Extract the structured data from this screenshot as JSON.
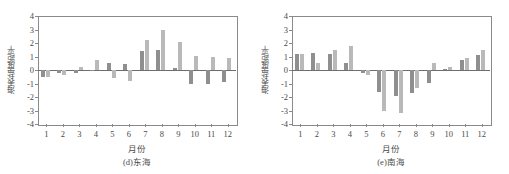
{
  "figure": {
    "ylabel": "海表盐度距平",
    "xlabel": "月份",
    "yticks": [
      "4",
      "3",
      "2",
      "1",
      "0",
      "-1",
      "-2",
      "-3",
      "-4"
    ],
    "xticks": [
      "1",
      "2",
      "3",
      "4",
      "5",
      "6",
      "7",
      "8",
      "9",
      "10",
      "11",
      "12"
    ],
    "colors": {
      "series1": "#8f8f8f",
      "series2": "#b9b9b9",
      "axis": "#8a8a8a",
      "text": "#4a4a4a"
    }
  },
  "chart_data": [
    {
      "type": "bar",
      "title": "(d)东海",
      "panel": "d",
      "xlabel": "月份",
      "ylabel": "海表盐度距平",
      "ylim": [
        -4,
        4
      ],
      "yticks": [
        4,
        3,
        2,
        1,
        0,
        -1,
        -2,
        -3,
        -4
      ],
      "grid": false,
      "legend": "none",
      "categories": [
        "1",
        "2",
        "3",
        "4",
        "5",
        "6",
        "7",
        "8",
        "9",
        "10",
        "11",
        "12"
      ],
      "series": [
        {
          "name": "series1",
          "color": "#8f8f8f",
          "values": [
            -0.55,
            -0.25,
            -0.2,
            -0.1,
            0.5,
            0.45,
            1.4,
            1.5,
            0.15,
            -1.0,
            -1.0,
            -0.9
          ]
        },
        {
          "name": "series2",
          "color": "#b9b9b9",
          "values": [
            -0.5,
            -0.35,
            0.2,
            0.75,
            -0.6,
            -0.85,
            2.25,
            2.95,
            2.05,
            1.05,
            0.95,
            0.9
          ]
        }
      ]
    },
    {
      "type": "bar",
      "title": "(e)南海",
      "panel": "e",
      "xlabel": "月份",
      "ylabel": "海表盐度距平",
      "ylim": [
        -4,
        4
      ],
      "yticks": [
        4,
        3,
        2,
        1,
        0,
        -1,
        -2,
        -3,
        -4
      ],
      "grid": false,
      "legend": "none",
      "categories": [
        "1",
        "2",
        "3",
        "4",
        "5",
        "6",
        "7",
        "8",
        "9",
        "10",
        "11",
        "12"
      ],
      "series": [
        {
          "name": "series1",
          "color": "#8f8f8f",
          "values": [
            1.15,
            1.25,
            1.2,
            0.55,
            -0.2,
            -1.6,
            -1.95,
            -1.7,
            -0.95,
            0.1,
            0.75,
            1.1
          ]
        },
        {
          "name": "series2",
          "color": "#b9b9b9",
          "values": [
            1.15,
            0.5,
            1.45,
            1.8,
            -0.4,
            -3.0,
            -3.2,
            -1.3,
            0.55,
            0.25,
            0.9,
            1.5
          ]
        }
      ]
    }
  ]
}
